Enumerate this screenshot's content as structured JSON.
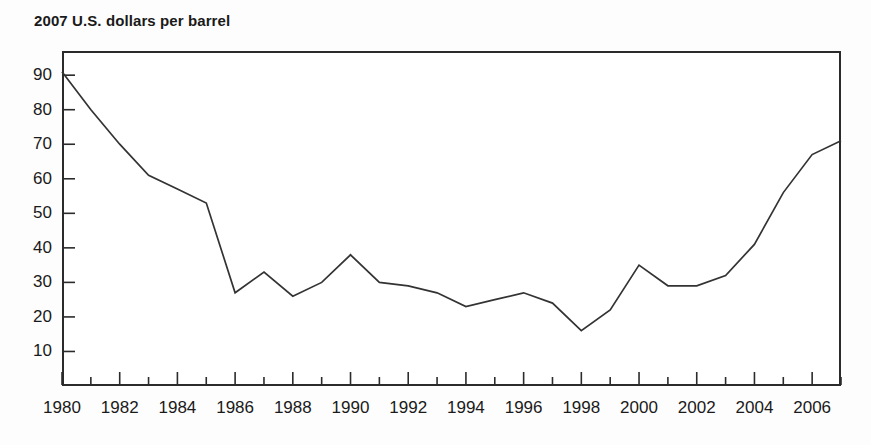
{
  "chart_data": {
    "type": "line",
    "title": "2007 U.S. dollars per barrel",
    "xlabel": "",
    "ylabel": "",
    "xlim": [
      1980,
      2007
    ],
    "ylim": [
      0,
      97
    ],
    "yticks": [
      10,
      20,
      30,
      40,
      50,
      60,
      70,
      80,
      90
    ],
    "xticks": [
      1980,
      1982,
      1984,
      1986,
      1988,
      1990,
      1992,
      1994,
      1996,
      1998,
      2000,
      2002,
      2004,
      2006
    ],
    "x_minor_ticks_every": 1,
    "grid": false,
    "legend": null,
    "line_color": "#333333",
    "x": [
      1980,
      1981,
      1982,
      1983,
      1984,
      1985,
      1986,
      1987,
      1988,
      1989,
      1990,
      1991,
      1992,
      1993,
      1994,
      1995,
      1996,
      1997,
      1998,
      1999,
      2000,
      2001,
      2002,
      2003,
      2004,
      2005,
      2006,
      2007
    ],
    "values": [
      91,
      80,
      70,
      61,
      57,
      53,
      27,
      33,
      26,
      30,
      38,
      30,
      29,
      27,
      23,
      25,
      27,
      24,
      16,
      22,
      35,
      29,
      29,
      32,
      41,
      56,
      67,
      71
    ],
    "series": [
      {
        "name": "Crude oil price",
        "values": [
          91,
          80,
          70,
          61,
          57,
          53,
          27,
          33,
          26,
          30,
          38,
          30,
          29,
          27,
          23,
          25,
          27,
          24,
          16,
          22,
          35,
          29,
          29,
          32,
          41,
          56,
          67,
          71
        ]
      }
    ]
  },
  "axis": {
    "ytick_labels": [
      "90",
      "80",
      "70",
      "60",
      "50",
      "40",
      "30",
      "20",
      "10"
    ],
    "xtick_labels": [
      "1980",
      "1982",
      "1984",
      "1986",
      "1988",
      "1990",
      "1992",
      "1994",
      "1996",
      "1998",
      "2000",
      "2002",
      "2004",
      "2006"
    ]
  }
}
